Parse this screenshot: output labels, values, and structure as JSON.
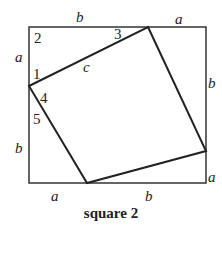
{
  "caption": "square 2",
  "outer_square": {
    "x1": 29,
    "y1": 27,
    "x2": 206,
    "y2": 183
  },
  "inner_square": {
    "points": [
      [
        148,
        27
      ],
      [
        206,
        151
      ],
      [
        87,
        183
      ],
      [
        29,
        86
      ]
    ]
  },
  "labels": {
    "top_b": "b",
    "top_a": "a",
    "left_a": "a",
    "left_b": "b",
    "right_b": "b",
    "right_a": "a",
    "bottom_a": "a",
    "bottom_b": "b",
    "hyp_c": "c",
    "angle_1": "1",
    "angle_2": "2",
    "angle_3": "3",
    "angle_4": "4",
    "angle_5": "5"
  },
  "colors": {
    "stroke": "#222222",
    "background": "#ffffff"
  }
}
